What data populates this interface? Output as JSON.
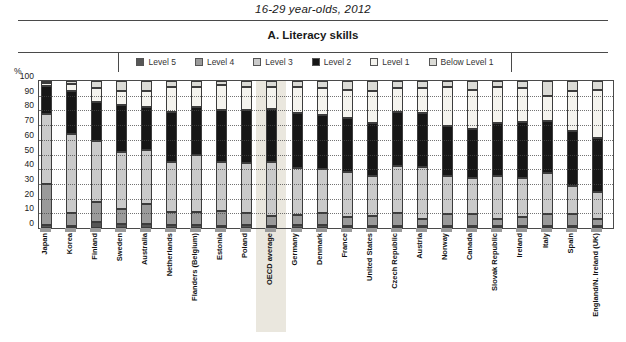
{
  "title": "16-29 year-olds, 2012",
  "panel_title": "A. Literacy skills",
  "y_axis": {
    "unit_label": "%",
    "ticks": [
      100,
      90,
      80,
      70,
      60,
      50,
      40,
      30,
      20,
      10,
      0
    ],
    "range": [
      0,
      100
    ]
  },
  "legend": {
    "items": [
      {
        "label": "Level 5",
        "color": "#565656"
      },
      {
        "label": "Level 4",
        "color": "#9a9a9a"
      },
      {
        "label": "Level 3",
        "color": "#cacaca"
      },
      {
        "label": "Level 2",
        "color": "#161616"
      },
      {
        "label": "Level 1",
        "color": "#f4f3ee"
      },
      {
        "label": "Below Level 1",
        "color": "#dbdbd6"
      }
    ]
  },
  "chart_data": {
    "type": "bar",
    "stacked": true,
    "title": "A. Literacy skills",
    "subtitle": "16-29 year-olds, 2012",
    "ylabel": "%",
    "ylim": [
      0,
      100
    ],
    "grid": "dotted-horizontal",
    "legend_position": "top",
    "highlighted_category": "OECD average",
    "highlight_color": "#eae7de",
    "categories": [
      "Japan",
      "Korea",
      "Finland",
      "Sweden",
      "Australia",
      "Netherlands",
      "Flanders (Belgium)",
      "Estonia",
      "Poland",
      "OECD average",
      "Germany",
      "Denmark",
      "France",
      "United States",
      "Czech Republic",
      "Austria",
      "Norway",
      "Canada",
      "Slovak Republic",
      "Ireland",
      "Italy",
      "Spain",
      "England/N. Ireland (UK)"
    ],
    "series": [
      {
        "name": "Level 5",
        "color": "#565656",
        "values": [
          2,
          1,
          4,
          3,
          3,
          2,
          2,
          1,
          2,
          1,
          2,
          2,
          1,
          1,
          1,
          1,
          1,
          1,
          1,
          1,
          1,
          1,
          1
        ]
      },
      {
        "name": "Level 4",
        "color": "#9a9a9a",
        "values": [
          28,
          9,
          14,
          10,
          13,
          9,
          9,
          10,
          8,
          7,
          7,
          8,
          6,
          7,
          9,
          5,
          8,
          8,
          5,
          6,
          8,
          8,
          5
        ]
      },
      {
        "name": "Level 3",
        "color": "#cacaca",
        "values": [
          48,
          54,
          41,
          39,
          37,
          34,
          39,
          34,
          34,
          37,
          32,
          30,
          31,
          27,
          32,
          35,
          26,
          25,
          29,
          27,
          28,
          19,
          18
        ]
      },
      {
        "name": "Level 2",
        "color": "#161616",
        "values": [
          19,
          29,
          27,
          32,
          29,
          34,
          32,
          35,
          36,
          36,
          37,
          37,
          37,
          36,
          37,
          37,
          34,
          33,
          36,
          38,
          36,
          38,
          37
        ]
      },
      {
        "name": "Level 1",
        "color": "#f4f3ee",
        "values": [
          2,
          5,
          9,
          9,
          11,
          17,
          14,
          17,
          16,
          15,
          18,
          18,
          19,
          22,
          16,
          17,
          27,
          27,
          25,
          23,
          17,
          27,
          33
        ]
      },
      {
        "name": "Below Level 1",
        "color": "#dbdbd6",
        "values": [
          1,
          2,
          5,
          7,
          7,
          4,
          4,
          3,
          4,
          4,
          4,
          5,
          6,
          7,
          5,
          5,
          4,
          6,
          4,
          5,
          10,
          7,
          6
        ]
      }
    ]
  }
}
